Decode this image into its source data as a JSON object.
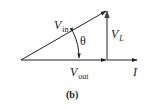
{
  "diagram": {
    "type": "phasor-diagram",
    "caption": "(b)",
    "colors": {
      "stroke": "#222222",
      "vertical_stroke": "#555555",
      "text": "#1a1a1a",
      "background": "#ffffff"
    },
    "phasors": [
      {
        "name": "V_in",
        "label_main": "V",
        "label_sub": "in",
        "from": [
          21,
          60
        ],
        "to": [
          107,
          10
        ]
      },
      {
        "name": "V_L",
        "label_main": "V",
        "label_sub": "L",
        "from": [
          107,
          60
        ],
        "to": [
          107,
          10
        ]
      },
      {
        "name": "V_out",
        "label_main": "V",
        "label_sub": "out",
        "from": [
          21,
          60
        ],
        "to": [
          107,
          60
        ]
      },
      {
        "name": "I",
        "label_main": "I",
        "label_sub": "",
        "from": [
          107,
          60
        ],
        "to": [
          138,
          60
        ]
      }
    ],
    "angle": {
      "symbol": "θ",
      "between": [
        "V_in",
        "V_out"
      ]
    }
  }
}
